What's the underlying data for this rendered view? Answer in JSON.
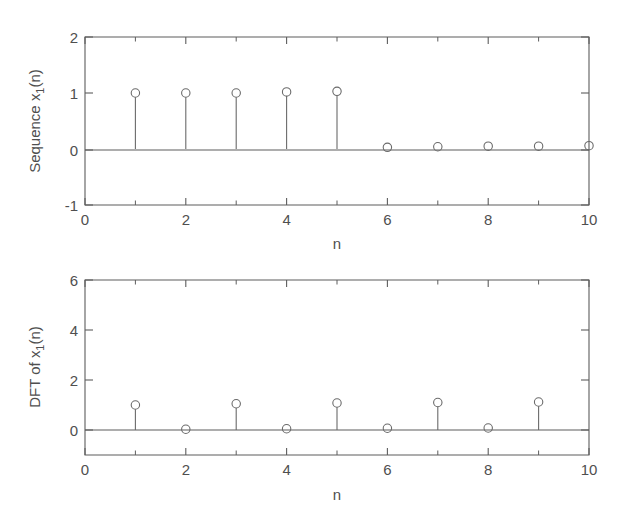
{
  "figure": {
    "background": "#ffffff",
    "line_color": "#5d5d5d",
    "marker_color": "#6a6a6a",
    "text_color": "#4f4f4f"
  },
  "chart_data": [
    {
      "id": "top",
      "type": "scatter",
      "plot_style": "stem",
      "title": "",
      "xlabel": "n",
      "ylabel": "Sequence x_1(n)",
      "ylabel_parts": {
        "pre": "Sequence x",
        "sub": "1",
        "post": "(n)"
      },
      "xlim": [
        0,
        10
      ],
      "ylim": [
        -1,
        2
      ],
      "xticks": [
        0,
        2,
        4,
        6,
        8,
        10
      ],
      "xticklabels": [
        "0",
        "2",
        "4",
        "6",
        "8",
        "10"
      ],
      "xticks_minor": [
        1,
        3,
        5,
        7,
        9
      ],
      "yticks": [
        -1,
        0,
        1,
        2
      ],
      "yticklabels": [
        "-1",
        "0",
        "1",
        "2"
      ],
      "grid": false,
      "legend": null,
      "x": [
        1,
        2,
        3,
        4,
        5,
        6,
        7,
        8,
        9,
        10
      ],
      "values": [
        1.0,
        1.0,
        1.0,
        1.02,
        1.03,
        0.03,
        0.04,
        0.05,
        0.05,
        0.06
      ]
    },
    {
      "id": "bottom",
      "type": "scatter",
      "plot_style": "stem",
      "title": "",
      "xlabel": "n",
      "ylabel": "DFT of x_1(n)",
      "ylabel_parts": {
        "pre": "DFT of x",
        "sub": "1",
        "post": "(n)"
      },
      "xlim": [
        0,
        10
      ],
      "ylim": [
        -1,
        6
      ],
      "xticks": [
        0,
        2,
        4,
        6,
        8,
        10
      ],
      "xticklabels": [
        "0",
        "2",
        "4",
        "6",
        "8",
        "10"
      ],
      "xticks_minor": [
        1,
        3,
        5,
        7,
        9
      ],
      "yticks": [
        0,
        2,
        4,
        6
      ],
      "yticklabels": [
        "0",
        "2",
        "4",
        "6"
      ],
      "grid": false,
      "legend": null,
      "x": [
        1,
        2,
        3,
        4,
        5,
        6,
        7,
        8,
        9
      ],
      "values": [
        1.0,
        0.03,
        1.05,
        0.05,
        1.08,
        0.07,
        1.1,
        0.08,
        1.12
      ]
    }
  ]
}
